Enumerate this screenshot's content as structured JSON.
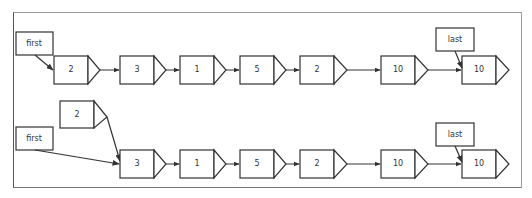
{
  "diagram": {
    "title": "",
    "rows": [
      {
        "name": "before",
        "pointers": [
          {
            "label": "first",
            "target_index": 0
          },
          {
            "label": "last",
            "target_index": 6
          }
        ],
        "nodes": [
          {
            "value": "2"
          },
          {
            "value": "3"
          },
          {
            "value": "1"
          },
          {
            "value": "5"
          },
          {
            "value": "2"
          },
          {
            "value": "10"
          },
          {
            "value": "10"
          }
        ]
      },
      {
        "name": "after",
        "new_node": {
          "value": "2",
          "points_to_index": 0
        },
        "pointers": [
          {
            "label": "first",
            "target_index": 0
          },
          {
            "label": "last",
            "target_index": 5
          }
        ],
        "nodes": [
          {
            "value": "3"
          },
          {
            "value": "1"
          },
          {
            "value": "5"
          },
          {
            "value": "2"
          },
          {
            "value": "10"
          },
          {
            "value": "10"
          }
        ]
      }
    ],
    "colors": {
      "stroke": "#333333",
      "fill": "#ffffff",
      "frame": "#888888",
      "text": "#333333"
    }
  }
}
